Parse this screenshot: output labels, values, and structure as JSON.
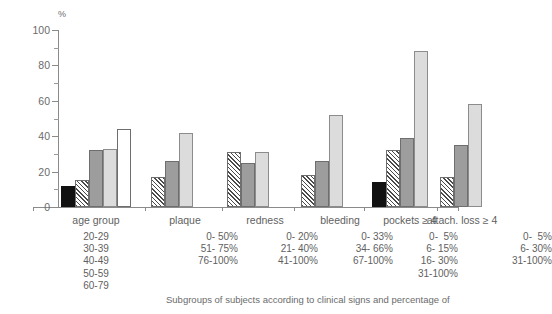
{
  "chart_data": {
    "type": "bar",
    "title": "",
    "subtitle": "",
    "xlabel": "",
    "ylabel": "%",
    "ylim": [
      0,
      100
    ],
    "yticks": [
      0,
      20,
      40,
      60,
      80,
      100
    ],
    "yminor": [
      10,
      30,
      50,
      70,
      90
    ],
    "grid": false,
    "legend_position": "none",
    "categories": [
      "age group",
      "plaque",
      "redness",
      "bleeding",
      "pockets ≥ 4",
      "attach. loss ≥ 4"
    ],
    "groups": [
      {
        "name": "age group",
        "subgroups": [
          "20-29",
          "30-39",
          "40-49",
          "50-59",
          "60-79"
        ],
        "values": [
          12,
          15,
          32,
          33,
          44
        ],
        "fills": [
          "black",
          "hatch",
          "dark",
          "light",
          "white"
        ]
      },
      {
        "name": "plaque",
        "subgroups": [
          "0- 50%",
          "51- 75%",
          "76-100%"
        ],
        "values": [
          17,
          26,
          42
        ],
        "fills": [
          "hatch",
          "dark",
          "light"
        ]
      },
      {
        "name": "redness",
        "subgroups": [
          "0- 20%",
          "21- 40%",
          "41-100%"
        ],
        "values": [
          31,
          25,
          31
        ],
        "fills": [
          "hatch",
          "dark",
          "light"
        ]
      },
      {
        "name": "bleeding",
        "subgroups": [
          "0- 33%",
          "34- 66%",
          "67-100%"
        ],
        "values": [
          18,
          26,
          52
        ],
        "fills": [
          "hatch",
          "dark",
          "light"
        ]
      },
      {
        "name": "pockets ≥ 4",
        "subgroups": [
          "0- 5%",
          "6- 15%",
          "16- 30%",
          "31-100%"
        ],
        "values": [
          14,
          32,
          39,
          88
        ],
        "fills": [
          "black",
          "hatch",
          "dark",
          "light"
        ]
      },
      {
        "name": "attach. loss ≥ 4",
        "subgroups": [
          "0- 5%",
          "6- 30%",
          "31-100%"
        ],
        "values": [
          17,
          35,
          58
        ],
        "fills": [
          "hatch",
          "dark",
          "light"
        ]
      }
    ]
  },
  "axis": {
    "unit_label": "%",
    "tick_labels": [
      "100",
      "80",
      "60",
      "40",
      "20",
      "0"
    ]
  },
  "group_labels": {
    "g0": "age group",
    "g1": "plaque",
    "g2": "redness",
    "g3": "bleeding",
    "g4": "pockets ≥ 4",
    "g5": "attach. loss ≥ 4"
  },
  "sub_labels": {
    "g0": "20-29\n30-39\n40-49\n50-59\n60-79",
    "g1": "0- 50%\n51- 75%\n76-100%",
    "g2": "0- 20%\n21- 40%\n41-100%",
    "g3": "0- 33%\n34- 66%\n67-100%",
    "g4": "0-  5%\n6- 15%\n16- 30%\n31-100%",
    "g5": "0-  5%\n6- 30%\n31-100%"
  },
  "caption": {
    "text": "Subgroups of subjects according to clinical signs and percentage of"
  },
  "colors": {
    "axis": "#8a8a8a",
    "text": "#5f5f5f",
    "bar_black": "#111111",
    "bar_dark": "#9d9d9d",
    "bar_light": "#dcdcdc",
    "bar_white": "#ffffff",
    "bar_outline": "#6e6e6e"
  }
}
